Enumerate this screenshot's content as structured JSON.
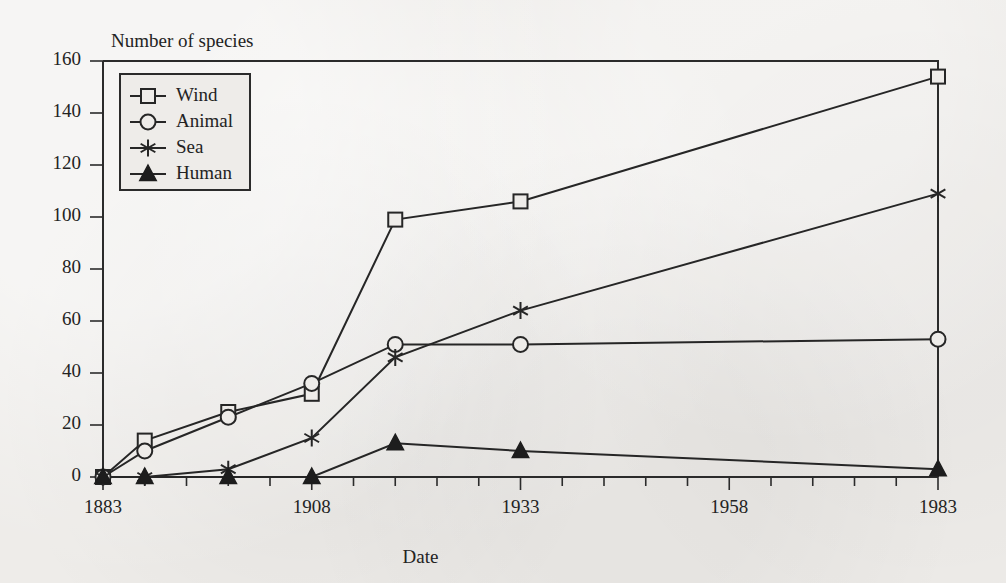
{
  "chart_data": {
    "type": "line",
    "title": "Number of species",
    "xlabel": "Date",
    "ylabel": "",
    "axis_title_top_left": "Number of species",
    "x": [
      1883,
      1888,
      1898,
      1908,
      1918,
      1933,
      1983
    ],
    "xlim": [
      1883,
      1983
    ],
    "ylim": [
      0,
      160
    ],
    "xticks": [
      1883,
      1908,
      1933,
      1958,
      1983
    ],
    "xticklabels": [
      "1883",
      "1908",
      "1933",
      "1958",
      "1983"
    ],
    "xminorticks": [
      1888,
      1893,
      1898,
      1903,
      1913,
      1918,
      1923,
      1928,
      1938,
      1943,
      1948,
      1953,
      1963,
      1968,
      1973,
      1978
    ],
    "yticks": [
      0,
      20,
      40,
      60,
      80,
      100,
      120,
      140,
      160
    ],
    "yticklabels": [
      "0",
      "20",
      "40",
      "60",
      "80",
      "100",
      "120",
      "140",
      "160"
    ],
    "grid": false,
    "legend_position": "upper left",
    "series": [
      {
        "name": "Wind",
        "marker": "open-square",
        "values": [
          0,
          14,
          25,
          32,
          99,
          106,
          154
        ]
      },
      {
        "name": "Animal",
        "marker": "open-circle",
        "values": [
          0,
          10,
          23,
          36,
          51,
          51,
          53
        ]
      },
      {
        "name": "Sea",
        "marker": "star",
        "values": [
          0,
          0,
          3,
          15,
          46,
          64,
          109
        ]
      },
      {
        "name": "Human",
        "marker": "filled-triangle",
        "values": [
          0,
          0,
          0,
          0,
          13,
          10,
          3
        ]
      }
    ]
  },
  "legend": {
    "entries": [
      {
        "label": "Wind"
      },
      {
        "label": "Animal"
      },
      {
        "label": "Sea"
      },
      {
        "label": "Human"
      }
    ]
  },
  "colors": {
    "background": "#eeece9",
    "ink": "#262626",
    "axis": "#2b2b2b"
  }
}
